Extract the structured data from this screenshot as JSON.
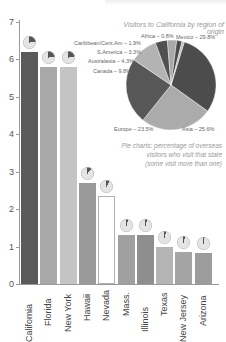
{
  "chart_data": [
    {
      "type": "bar",
      "title": "",
      "xlabel": "",
      "ylabel": "",
      "ylim": [
        0,
        7
      ],
      "yticks": [
        0,
        1,
        2,
        3,
        4,
        5,
        6,
        7
      ],
      "grid": false,
      "categories": [
        "California",
        "Florida",
        "New York",
        "Hawaii",
        "Nevada",
        "Mass.",
        "Illinois",
        "Texas",
        "New Jersey",
        "Arizona"
      ],
      "values": [
        6.2,
        5.8,
        5.8,
        2.7,
        2.35,
        1.3,
        1.3,
        1.0,
        0.85,
        0.83
      ],
      "bar_colors": [
        "#5a5a5a",
        "#a8a8a8",
        "#c4c4c4",
        "#9a9a9a",
        "#ffffff",
        "#a0a0a0",
        "#8e8e8e",
        "#b4b4b4",
        "#a4a4a4",
        "#9c9c9c"
      ],
      "mini_pie_percent": [
        25,
        23,
        22,
        11,
        8,
        5,
        5,
        4,
        4,
        3
      ]
    },
    {
      "type": "pie",
      "title": "Visitors to California by region of origin",
      "slices": [
        {
          "label": "Mexico",
          "value": 29.8,
          "text": "Mexico – 29.8%",
          "color": "#4c4c4c"
        },
        {
          "label": "Asia",
          "value": 25.6,
          "text": "Asia – 25.6%",
          "color": "#ababab"
        },
        {
          "label": "Europe",
          "value": 23.5,
          "text": "Europe – 23.5%",
          "color": "#575757"
        },
        {
          "label": "Canada",
          "value": 9.8,
          "text": "Canada – 9.8%",
          "color": "#b3b3b3"
        },
        {
          "label": "Australasia",
          "value": 4.3,
          "text": "Australasia – 4.3%",
          "color": "#505050"
        },
        {
          "label": "S.America",
          "value": 3.3,
          "text": "S.America – 3.3%",
          "color": "#a9a9a9"
        },
        {
          "label": "Caribbean/Cent.Am",
          "value": 1.9,
          "text": "Caribbean/Cent.Am – 1.9%",
          "color": "#4a4a4a"
        },
        {
          "label": "Africa",
          "value": 0.8,
          "text": "Africa – 0.8%",
          "color": "#bdbdbd"
        }
      ],
      "note": "Pie charts: percentage of overseas visitors who visit that state (some visit more than one)"
    }
  ],
  "labels": {
    "pie_title": "Visitors to California by region of origin",
    "note_line1": "Pie charts: percentage of overseas",
    "note_line2": "visitors who visit that state",
    "note_line3": "(some visit more than one)",
    "mexico": "Mexico – 29.8%",
    "asia": "Asia – 25.6%",
    "europe": "Europe – 23.5%",
    "canada": "Canada – 9.8%",
    "australasia": "Australasia – 4.3%",
    "samerica": "S.America – 3.3%",
    "caribbean": "Caribbean/Cent.Am – 1.9%",
    "africa": "Africa – 0.8%",
    "y0": "0",
    "y1": "1",
    "y2": "2",
    "y3": "3",
    "y4": "4",
    "y5": "5",
    "y6": "6",
    "y7": "7"
  }
}
